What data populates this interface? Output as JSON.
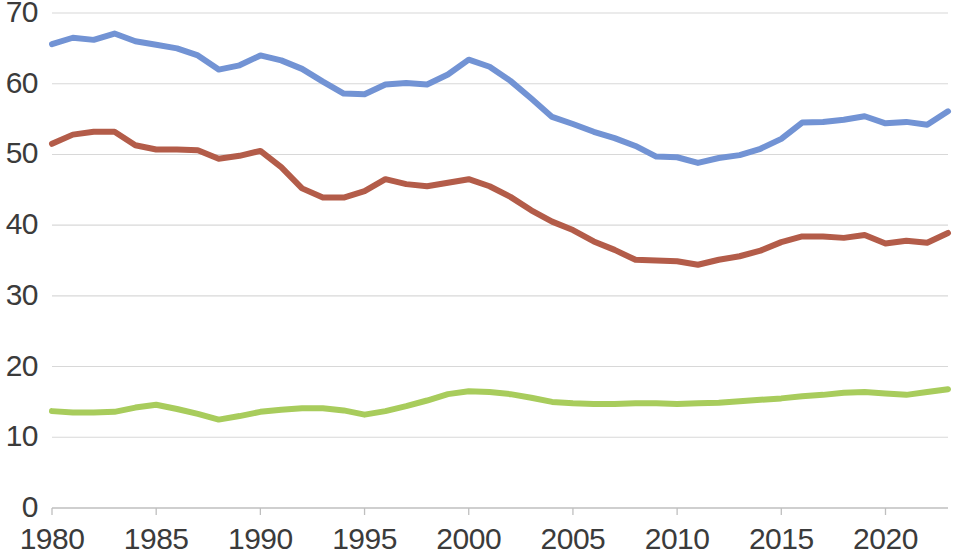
{
  "chart_data": {
    "type": "line",
    "title": "",
    "subtitle": "",
    "xlabel": "",
    "ylabel": "",
    "xlim": [
      1980,
      2023
    ],
    "ylim": [
      0,
      70
    ],
    "grid": true,
    "grid_axis": "y",
    "legend": "none",
    "background": "#ffffff",
    "y_ticks": [
      0,
      10,
      20,
      30,
      40,
      50,
      60,
      70
    ],
    "y_tick_labels": [
      "0",
      "10",
      "20",
      "30",
      "40",
      "50",
      "60",
      "70"
    ],
    "x_ticks": [
      1980,
      1985,
      1990,
      1995,
      2000,
      2005,
      2010,
      2015,
      2020
    ],
    "x_tick_labels": [
      "1980",
      "1985",
      "1990",
      "1995",
      "2000",
      "2005",
      "2010",
      "2015",
      "2020"
    ],
    "x": [
      1980,
      1981,
      1982,
      1983,
      1984,
      1985,
      1986,
      1987,
      1988,
      1989,
      1990,
      1991,
      1992,
      1993,
      1994,
      1995,
      1996,
      1997,
      1998,
      1999,
      2000,
      2001,
      2002,
      2003,
      2004,
      2005,
      2006,
      2007,
      2008,
      2009,
      2010,
      2011,
      2012,
      2013,
      2014,
      2015,
      2016,
      2017,
      2018,
      2019,
      2020,
      2021,
      2022,
      2023
    ],
    "series": [
      {
        "name": "series-blue",
        "color": "#7293d4",
        "line_width": 6,
        "values": [
          65.6,
          66.5,
          66.2,
          67.1,
          66.0,
          65.5,
          65.0,
          64.0,
          62.0,
          62.6,
          64.0,
          63.3,
          62.1,
          60.3,
          58.6,
          58.5,
          59.9,
          60.1,
          59.9,
          61.3,
          63.4,
          62.4,
          60.4,
          57.9,
          55.3,
          54.3,
          53.2,
          52.3,
          51.2,
          49.7,
          49.6,
          48.8,
          49.5,
          49.9,
          50.8,
          52.2,
          54.5,
          54.6,
          54.9,
          55.4,
          54.4,
          54.6,
          54.2,
          56.1
        ]
      },
      {
        "name": "series-red",
        "color": "#b35c49",
        "line_width": 6,
        "values": [
          51.5,
          52.8,
          53.2,
          53.2,
          51.3,
          50.7,
          50.7,
          50.6,
          49.4,
          49.8,
          50.5,
          48.2,
          45.2,
          43.9,
          43.9,
          44.8,
          46.5,
          45.8,
          45.5,
          46.0,
          46.5,
          45.5,
          44.0,
          42.1,
          40.5,
          39.3,
          37.7,
          36.5,
          35.1,
          35.0,
          34.9,
          34.4,
          35.1,
          35.6,
          36.4,
          37.6,
          38.4,
          38.4,
          38.2,
          38.6,
          37.4,
          37.8,
          37.5,
          38.9
        ]
      },
      {
        "name": "series-green",
        "color": "#a8cc5c",
        "line_width": 6,
        "values": [
          13.7,
          13.5,
          13.5,
          13.6,
          14.2,
          14.6,
          14.0,
          13.3,
          12.5,
          13.0,
          13.6,
          13.9,
          14.1,
          14.1,
          13.8,
          13.2,
          13.7,
          14.4,
          15.2,
          16.1,
          16.5,
          16.4,
          16.1,
          15.6,
          15.0,
          14.8,
          14.7,
          14.7,
          14.8,
          14.8,
          14.7,
          14.8,
          14.9,
          15.1,
          15.3,
          15.5,
          15.8,
          16.0,
          16.3,
          16.4,
          16.2,
          16.0,
          16.4,
          16.8
        ]
      }
    ]
  },
  "plot_geometry": {
    "left": 52,
    "right": 948,
    "top": 13,
    "bottom": 508
  },
  "colors": {
    "grid": "#d8d8d8",
    "axis": "#bfbfbf",
    "tick_text": "#3b3b3b"
  }
}
